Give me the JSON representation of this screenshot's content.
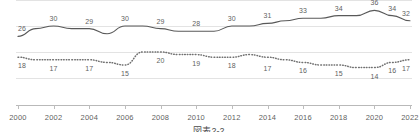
{
  "chart_data": {
    "type": "line",
    "title": "",
    "subtitle": "",
    "xlabel": "",
    "ylabel": "",
    "grid": true,
    "legend_position": "none",
    "xlim": [
      2000,
      2022
    ],
    "ylim": [
      0,
      40
    ],
    "x": [
      2000,
      2001,
      2002,
      2003,
      2004,
      2005,
      2006,
      2007,
      2008,
      2009,
      2010,
      2011,
      2012,
      2013,
      2014,
      2015,
      2016,
      2017,
      2018,
      2019,
      2020,
      2021,
      2022
    ],
    "xtick_labels": [
      "2000",
      "2002",
      "2004",
      "2006",
      "2008",
      "2010",
      "2012",
      "2014",
      "2016",
      "2018",
      "2020",
      "2022"
    ],
    "xticks": [
      2000,
      2002,
      2004,
      2006,
      2008,
      2010,
      2012,
      2014,
      2016,
      2018,
      2020,
      2022
    ],
    "series": [
      {
        "name": "series-solid",
        "style": "solid",
        "color": "#595959",
        "values": [
          26,
          29,
          30,
          29,
          29,
          27,
          30,
          30,
          29,
          28,
          28,
          28,
          30,
          30,
          31,
          32,
          33,
          33,
          34,
          34,
          36,
          34,
          32
        ],
        "labeled_points": [
          {
            "x": 2000,
            "value": 26
          },
          {
            "x": 2002,
            "value": 30
          },
          {
            "x": 2004,
            "value": 29
          },
          {
            "x": 2006,
            "value": 30
          },
          {
            "x": 2008,
            "value": 29
          },
          {
            "x": 2010,
            "value": 28
          },
          {
            "x": 2012,
            "value": 30
          },
          {
            "x": 2014,
            "value": 31
          },
          {
            "x": 2016,
            "value": 33
          },
          {
            "x": 2018,
            "value": 34
          },
          {
            "x": 2020,
            "value": 36
          },
          {
            "x": 2021,
            "value": 34
          },
          {
            "x": 2022,
            "value": 32
          }
        ]
      },
      {
        "name": "series-dotted",
        "style": "dotted",
        "color": "#707070",
        "values": [
          18,
          17,
          17,
          17,
          17,
          16,
          15,
          20,
          20,
          19,
          19,
          18,
          18,
          19,
          18,
          17,
          16,
          15,
          15,
          14,
          14,
          16,
          17
        ],
        "labeled_points": [
          {
            "x": 2000,
            "value": 18
          },
          {
            "x": 2002,
            "value": 17
          },
          {
            "x": 2004,
            "value": 17
          },
          {
            "x": 2006,
            "value": 15
          },
          {
            "x": 2008,
            "value": 20
          },
          {
            "x": 2010,
            "value": 19
          },
          {
            "x": 2012,
            "value": 18
          },
          {
            "x": 2014,
            "value": 17
          },
          {
            "x": 2016,
            "value": 16
          },
          {
            "x": 2018,
            "value": 15
          },
          {
            "x": 2020,
            "value": 14
          },
          {
            "x": 2021,
            "value": 16
          },
          {
            "x": 2022,
            "value": 17
          }
        ]
      }
    ],
    "gridline_values": [
      40,
      30,
      20,
      10
    ]
  },
  "caption": {
    "text": "図表2-2"
  }
}
